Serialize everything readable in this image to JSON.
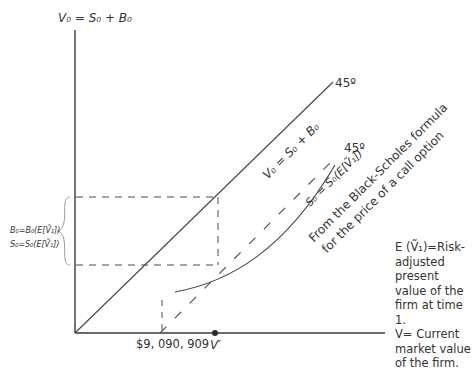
{
  "diagram": {
    "y_axis_label": "V₀ = S₀ + B₀",
    "line_45_label": "45º",
    "line_45_equation": "V₀ = S₀ + B₀",
    "dashed_45_label": "45º",
    "curve_equation": "S₀ = S₀(E[Ṽ₁])",
    "curve_annotation_line1": "From the Black-Scholes formula",
    "curve_annotation_line2": "for the price of a call option",
    "brace_label_b": "B₀=B₀(E[Ṽ₁])",
    "brace_label_s": "S₀=S₀(E[Ṽ₁])",
    "x_tick_value": "$9, 090, 909",
    "x_tick_v": "V′",
    "note_line1": "E (Ṽ₁)=Risk-adjusted present value of the firm at time 1.",
    "note_line2": "V= Current market value of the firm.",
    "colors": {
      "line": "#4a4a4a",
      "brace": "#9a9a9a",
      "text": "#333333"
    }
  }
}
